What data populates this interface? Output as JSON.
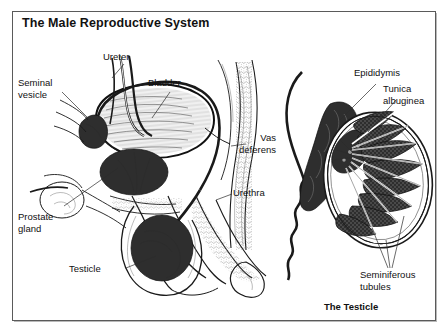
{
  "figure": {
    "title": "The Male Reproductive System",
    "caption_right": "The Testicle",
    "labels": {
      "ureter": "Ureter",
      "bladder": "Bladder",
      "seminal_vesicle": "Seminal\nvesicle",
      "vas_deferens": "Vas\ndeferens",
      "urethra": "Urethra",
      "prostate_gland": "Prostate\ngland",
      "testicle": "Testicle",
      "epididymis": "Epididymis",
      "tunica_albuginea": "Tunica\nalbuginea",
      "seminiferous_tubules": "Seminiferous\ntubules"
    },
    "colors": {
      "ink": "#1a1a1a",
      "frame": "#5a5a5a",
      "background": "#ffffff",
      "organ_dark": "#2e2e2e"
    }
  }
}
